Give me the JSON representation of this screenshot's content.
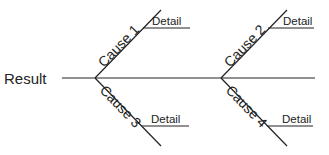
{
  "diagram": {
    "type": "fishbone",
    "result_label": "Result",
    "causes": [
      {
        "label": "Cause 1",
        "detail": "Detail"
      },
      {
        "label": "Cause 2",
        "detail": "Detail"
      },
      {
        "label": "Cause 3",
        "detail": "Detail"
      },
      {
        "label": "Cause 4",
        "detail": "Detail"
      }
    ],
    "line_color": "#222222"
  }
}
